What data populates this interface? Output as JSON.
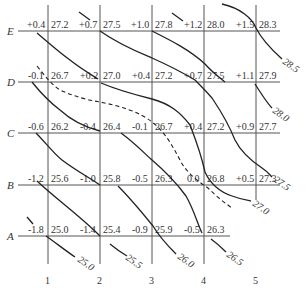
{
  "diagram": {
    "title": "",
    "row_labels": [
      "E",
      "D",
      "C",
      "B",
      "A"
    ],
    "column_labels": [
      "1",
      "2",
      "3",
      "4",
      "5"
    ],
    "grid": {
      "E": [
        {
          "col": 1,
          "offset": "+0.4",
          "value": "27.2"
        },
        {
          "col": 2,
          "offset": "+0.7",
          "value": "27.5"
        },
        {
          "col": 3,
          "offset": "+1.0",
          "value": "27.8"
        },
        {
          "col": 4,
          "offset": "+1.2",
          "value": "28.0"
        },
        {
          "col": 5,
          "offset": "+1.5",
          "value": "28.3"
        }
      ],
      "D": [
        {
          "col": 1,
          "offset": "-0.1",
          "value": "26.7"
        },
        {
          "col": 2,
          "offset": "+0.2",
          "value": "27.0"
        },
        {
          "col": 3,
          "offset": "+0.4",
          "value": "27.2"
        },
        {
          "col": 4,
          "offset": "+0.7",
          "value": "27.5"
        },
        {
          "col": 5,
          "offset": "+1.1",
          "value": "27.9"
        }
      ],
      "C": [
        {
          "col": 1,
          "offset": "-0.6",
          "value": "26.2"
        },
        {
          "col": 2,
          "offset": "-0.4",
          "value": "26.4"
        },
        {
          "col": 3,
          "offset": "-0.1",
          "value": "26.7"
        },
        {
          "col": 4,
          "offset": "+0.4",
          "value": "27.2"
        },
        {
          "col": 5,
          "offset": "+0.9",
          "value": "27.7"
        }
      ],
      "B": [
        {
          "col": 1,
          "offset": "-1.2",
          "value": "25.6"
        },
        {
          "col": 2,
          "offset": "-1.0",
          "value": "25.8"
        },
        {
          "col": 3,
          "offset": "-0.5",
          "value": "26.3"
        },
        {
          "col": 4,
          "offset": "0.0",
          "value": "26.8"
        },
        {
          "col": 5,
          "offset": "+0.5",
          "value": "27.3"
        }
      ],
      "A": [
        {
          "col": 1,
          "offset": "-1.8",
          "value": "25.0"
        },
        {
          "col": 2,
          "offset": "-1.4",
          "value": "25.4"
        },
        {
          "col": 3,
          "offset": "-0.9",
          "value": "25.9"
        },
        {
          "col": 4,
          "offset": "-0.5",
          "value": "26.3"
        }
      ]
    },
    "contour_labels": [
      "25.0",
      "25.5",
      "26.0",
      "26.5",
      "27.0",
      "27.5",
      "28.0",
      "28.5"
    ],
    "dashed_line": "design-elevation"
  }
}
